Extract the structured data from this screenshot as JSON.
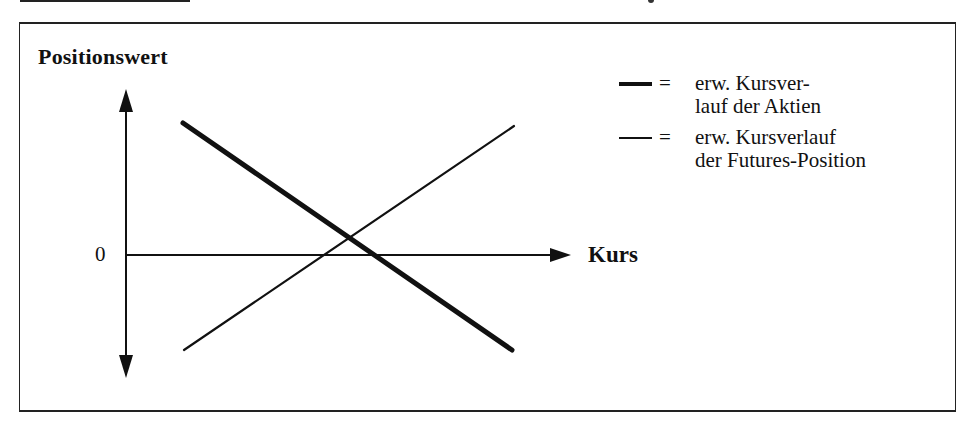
{
  "diagram": {
    "y_axis_label": "Positionswert",
    "x_axis_label": "Kurs",
    "origin_label": "0",
    "legend": [
      {
        "style": "thick",
        "symbol": "=",
        "line1": "erw. Kursver-",
        "line2": "lauf der Aktien"
      },
      {
        "style": "thin",
        "symbol": "=",
        "line1": "erw. Kursverlauf",
        "line2": "der Futures-Position"
      }
    ],
    "lines": [
      {
        "name": "Aktien",
        "style": "thick",
        "from": [
          183,
          123
        ],
        "to": [
          512,
          350
        ]
      },
      {
        "name": "Futures-Position",
        "style": "thin",
        "from": [
          184,
          350
        ],
        "to": [
          514,
          126
        ]
      }
    ],
    "colors": {
      "ink": "#111111",
      "background": "#ffffff"
    }
  }
}
